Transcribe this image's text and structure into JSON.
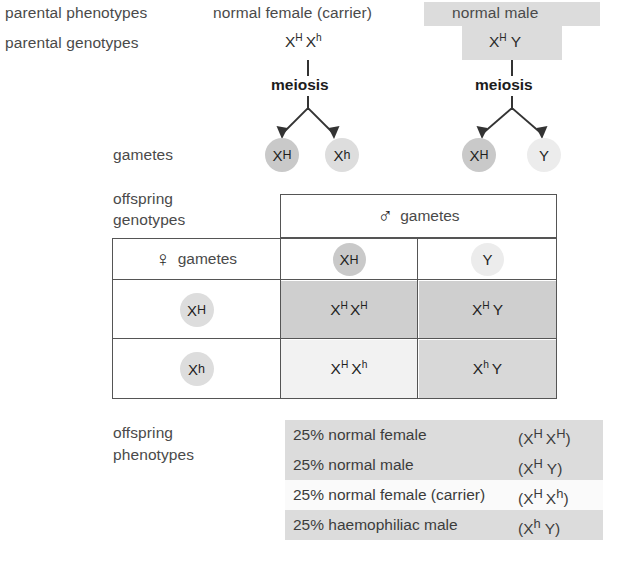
{
  "row_labels": {
    "parental_phenotypes": "parental phenotypes",
    "parental_genotypes": "parental genotypes",
    "gametes": "gametes",
    "offspring_genotypes_line1": "offspring",
    "offspring_genotypes_line2": "genotypes",
    "offspring_phenotypes_line1": "offspring",
    "offspring_phenotypes_line2": "phenotypes"
  },
  "parents": {
    "mother": {
      "phenotype": "normal female (carrier)",
      "genotype_plain": "XH Xh",
      "allele1": "X",
      "allele1_sup": "H",
      "allele2": "X",
      "allele2_sup": "h",
      "meiosis_label": "meiosis",
      "phenotype_shaded": false,
      "genotype_shaded": false
    },
    "father": {
      "phenotype": "normal male",
      "genotype_plain": "XH Y",
      "allele1": "X",
      "allele1_sup": "H",
      "allele2": "Y",
      "allele2_sup": "",
      "meiosis_label": "meiosis",
      "phenotype_shaded": true,
      "genotype_shaded": true
    }
  },
  "gametes": {
    "maternal": [
      {
        "base": "X",
        "sup": "H",
        "shade": "dark"
      },
      {
        "base": "X",
        "sup": "h",
        "shade": "mid"
      }
    ],
    "paternal": [
      {
        "base": "X",
        "sup": "H",
        "shade": "dark"
      },
      {
        "base": "Y",
        "sup": "",
        "shade": "pale"
      }
    ]
  },
  "punnett": {
    "male_header": {
      "symbol": "♂",
      "symbol_name": "male-symbol",
      "label": "gametes"
    },
    "female_header": {
      "symbol": "♀",
      "symbol_name": "female-symbol",
      "label": "gametes"
    },
    "column_gametes": [
      {
        "base": "X",
        "sup": "H",
        "shade": "dark"
      },
      {
        "base": "Y",
        "sup": "",
        "shade": "pale"
      }
    ],
    "row_gametes": [
      {
        "base": "X",
        "sup": "H",
        "shade": "mid"
      },
      {
        "base": "X",
        "sup": "h",
        "shade": "mid"
      }
    ],
    "cells": [
      [
        {
          "a1": "X",
          "s1": "H",
          "a2": "X",
          "s2": "H",
          "fill": "gray"
        },
        {
          "a1": "X",
          "s1": "H",
          "a2": "Y",
          "s2": "",
          "fill": "gray"
        }
      ],
      [
        {
          "a1": "X",
          "s1": "H",
          "a2": "X",
          "s2": "h",
          "fill": "pale"
        },
        {
          "a1": "X",
          "s1": "h",
          "a2": "Y",
          "s2": "",
          "fill": "mid"
        }
      ]
    ]
  },
  "offspring_phenotypes": [
    {
      "percent": "25%",
      "description": "normal female",
      "text": "25% normal female",
      "genotype_open": "(",
      "a1": "X",
      "s1": "H",
      "a2": "X",
      "s2": "H",
      "genotype_close": ")",
      "shaded": true
    },
    {
      "percent": "25%",
      "description": "normal male",
      "text": "25% normal male",
      "genotype_open": "(",
      "a1": "X",
      "s1": "H",
      "a2": "Y",
      "s2": "",
      "genotype_close": ")",
      "shaded": true
    },
    {
      "percent": "25%",
      "description": "normal female (carrier)",
      "text": "25% normal female (carrier)",
      "genotype_open": "(",
      "a1": "X",
      "s1": "H",
      "a2": "X",
      "s2": "h",
      "genotype_close": ")",
      "shaded": false
    },
    {
      "percent": "25%",
      "description": "haemophiliac male",
      "text": "25% haemophiliac male",
      "genotype_open": "(",
      "a1": "X",
      "s1": "h",
      "a2": "Y",
      "s2": "",
      "genotype_close": ")",
      "shaded": true
    }
  ],
  "colors": {
    "shade_gray": "#dcdcdc",
    "cell_gray": "#cfcfcf",
    "cell_mid": "#d8d8d8",
    "cell_pale": "#f2f2f2",
    "border": "#555555",
    "text": "#3c3c3c"
  }
}
